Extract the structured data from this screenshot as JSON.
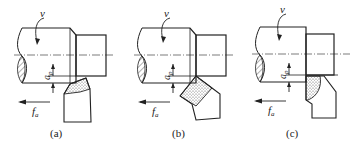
{
  "figure": {
    "panels": [
      {
        "id": "a",
        "caption": "(a)",
        "velocity_label": "v",
        "depth_label_main": "a",
        "depth_label_sub": "p",
        "feed_label_main": "f",
        "feed_label_sub": "a",
        "tool_type": "straight turning tool with dotted insert"
      },
      {
        "id": "b",
        "caption": "(b)",
        "velocity_label": "v",
        "depth_label_main": "a",
        "depth_label_sub": "p",
        "feed_label_main": "f",
        "feed_label_sub": "a",
        "tool_type": "angled turning tool with dotted insert"
      },
      {
        "id": "c",
        "caption": "(c)",
        "velocity_label": "v",
        "depth_label_main": "a",
        "depth_label_sub": "p",
        "feed_label_main": "f",
        "feed_label_sub": "a",
        "tool_type": "facing tool with dotted rounded insert"
      }
    ]
  }
}
